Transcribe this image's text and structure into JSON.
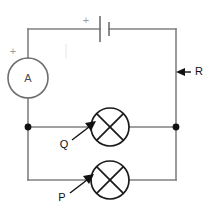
{
  "diagram": {
    "canvas": {
      "width": 213,
      "height": 213,
      "background": "#ffffff"
    },
    "colors": {
      "wire": "#808080",
      "component": "#6e6e6e",
      "lamp": "#1a1a1a",
      "label": "#111111",
      "polarity": "#9a9a9a",
      "node": "#111111",
      "ghost": "#ededed"
    },
    "components": {
      "battery": {
        "name": "battery",
        "symbol": "cell",
        "polarity_label": "+",
        "position": {
          "x": 104,
          "y": 29
        },
        "long_plate_x": 100,
        "short_plate_x": 109,
        "long_plate_half_height": 13,
        "short_plate_half_height": 7,
        "polarity_label_pos": {
          "x": 86,
          "y": 21
        }
      },
      "ammeter": {
        "name": "ammeter",
        "symbol": "circle-meter",
        "label": "A",
        "polarity_label": "+",
        "center": {
          "x": 28,
          "y": 78
        },
        "radius": 20,
        "polarity_label_pos": {
          "x": 13,
          "y": 52
        }
      },
      "lamp_q": {
        "name": "lamp-q",
        "symbol": "lamp-cross-circle",
        "label": "Q",
        "center": {
          "x": 110,
          "y": 127
        },
        "radius": 19,
        "label_pos": {
          "x": 60,
          "y": 145
        },
        "pointer": {
          "x1": 72,
          "y1": 140,
          "x2": 96,
          "y2": 121
        }
      },
      "lamp_p": {
        "name": "lamp-p",
        "symbol": "lamp-cross-circle",
        "label": "P",
        "center": {
          "x": 110,
          "y": 180
        },
        "radius": 19,
        "label_pos": {
          "x": 58,
          "y": 198
        },
        "pointer": {
          "x1": 70,
          "y1": 193,
          "x2": 94,
          "y2": 174
        }
      },
      "resistor_r": {
        "name": "branch-r",
        "label": "R",
        "label_pos": {
          "x": 195,
          "y": 76
        },
        "pointer": {
          "x1": 190,
          "y1": 72,
          "x2": 177,
          "y2": 72
        }
      }
    },
    "wires": {
      "outer_rect": {
        "left": 28,
        "right": 176,
        "top": 29,
        "bottom": 180
      },
      "middle_branch_y": 127,
      "nodes": [
        {
          "name": "node-left",
          "x": 28,
          "y": 127,
          "radius": 3.4
        },
        {
          "name": "node-right",
          "x": 176,
          "y": 127,
          "radius": 3.4
        }
      ]
    },
    "annotations": {
      "ghost_mark": {
        "x": 66,
        "y": 44,
        "height": 14
      }
    }
  }
}
